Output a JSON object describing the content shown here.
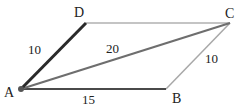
{
  "diagram": {
    "type": "parallelogram",
    "vertices": {
      "A": {
        "label": "A",
        "x": 21,
        "y": 89
      },
      "B": {
        "label": "B",
        "x": 166,
        "y": 89
      },
      "C": {
        "label": "C",
        "x": 230,
        "y": 23
      },
      "D": {
        "label": "D",
        "x": 86,
        "y": 23
      }
    },
    "edges": {
      "AD": {
        "label": "10",
        "color": "#2a2a2a",
        "width": 3
      },
      "AB": {
        "label": "15",
        "color": "#4a4a4a",
        "width": 1.8
      },
      "BC": {
        "label": "10",
        "color": "#a8a8a8",
        "width": 1.5
      },
      "DC": {
        "label": "",
        "color": "#b0b0b0",
        "width": 1.5
      },
      "AC": {
        "label": "20",
        "color": "#6e6e6e",
        "width": 2.2
      }
    },
    "point_A_color": "#555555"
  }
}
